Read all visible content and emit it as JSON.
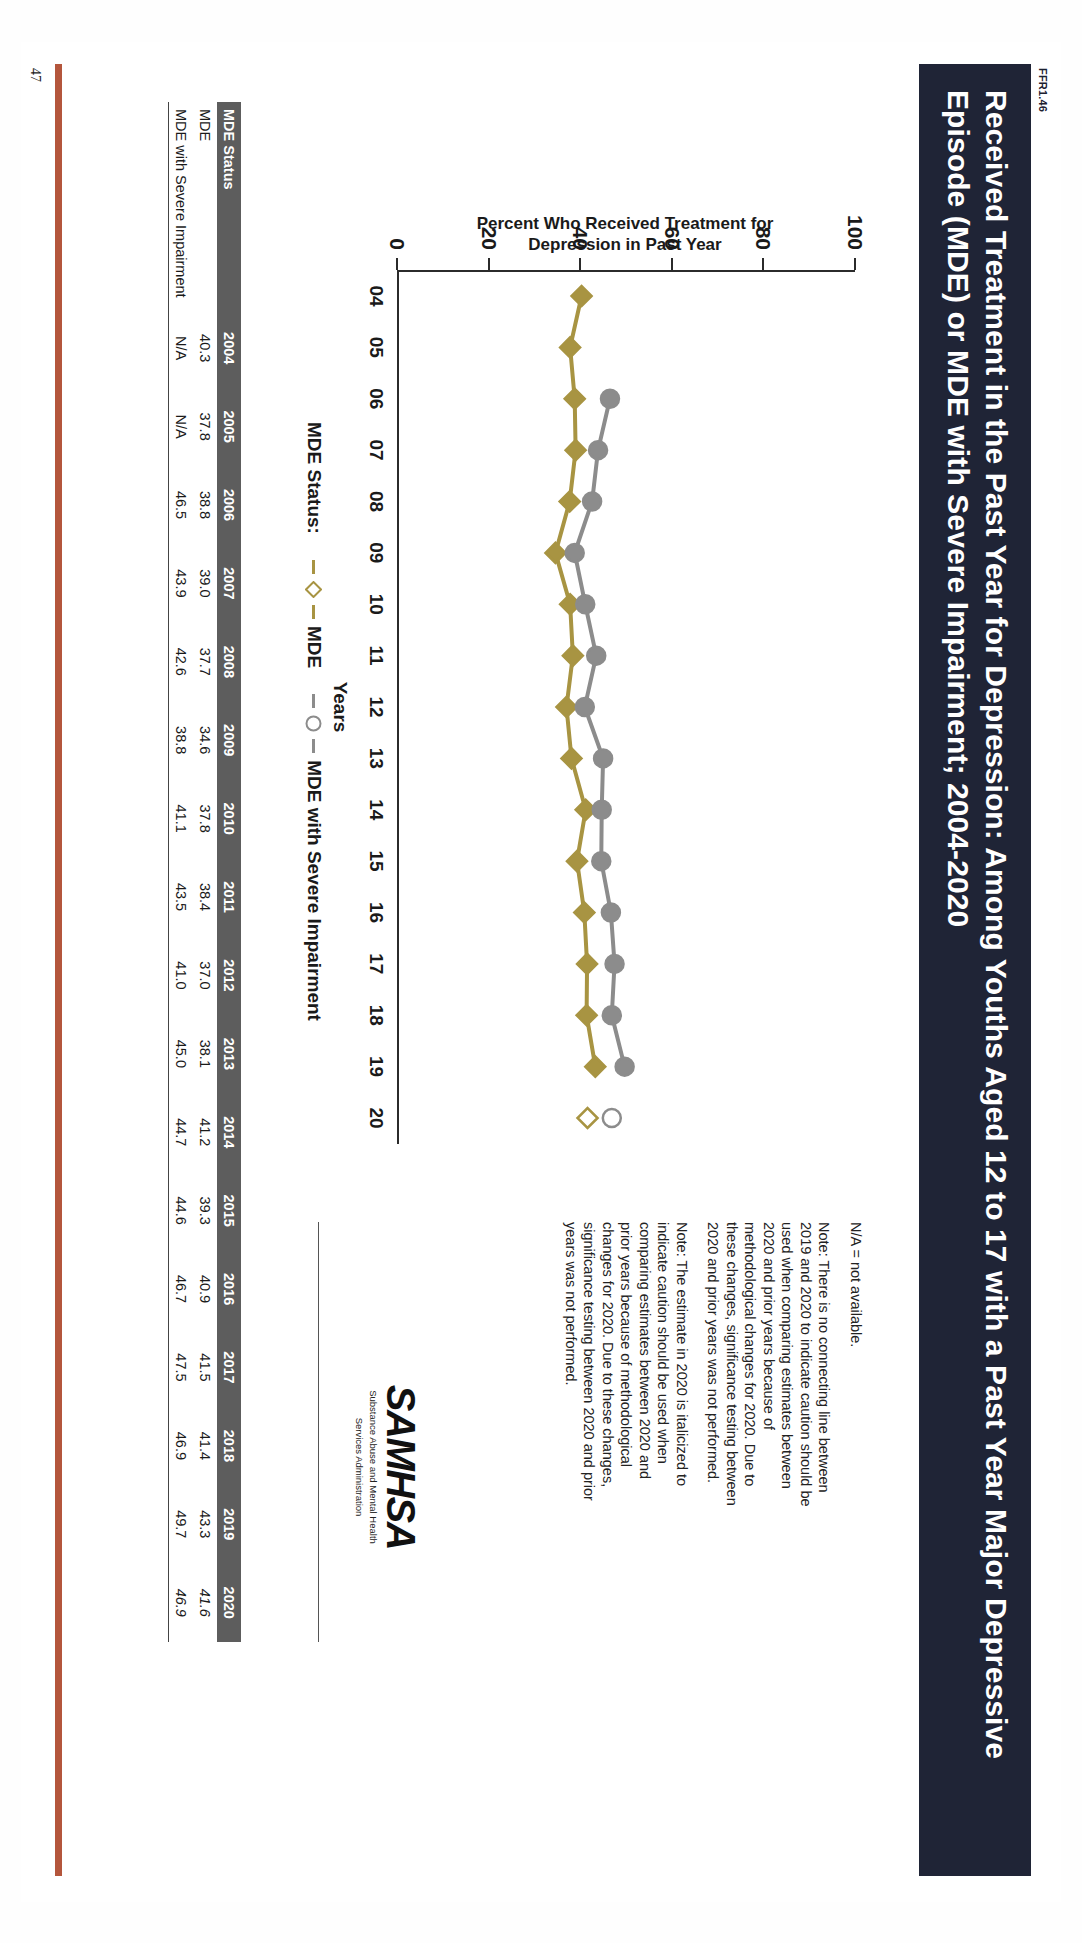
{
  "document": {
    "figure_code": "FFR1.46",
    "page_number": "47",
    "title": "Received Treatment in the Past Year for Depression: Among Youths Aged 12 to 17 with a Past Year Major Depressive Episode (MDE) or MDE with Severe Impairment; 2004-2020",
    "band_color": "#1f2436",
    "accent_rule_color": "#b4563c"
  },
  "notes": [
    "N/A = not available.",
    "Note: There is no connecting line between 2019 and 2020 to indicate caution should be used when comparing estimates between 2020 and prior years because of methodological changes for 2020. Due to these changes, significance testing between 2020 and prior years was not performed.",
    "Note: The estimate in 2020 is italicized to indicate caution should be used when comparing estimates between 2020 and prior years because of methodological changes for 2020. Due to these changes, significance testing between 2020 and prior years was not performed."
  ],
  "logo": {
    "mark": "SAMHSA",
    "line1": "Substance Abuse and Mental Health",
    "line2": "Services Administration"
  },
  "legend": {
    "prefix": "MDE Status:",
    "items": [
      {
        "label": "MDE",
        "color": "#a89442",
        "symbol": "diamond"
      },
      {
        "label": "MDE with Severe Impairment",
        "color": "#8c8c8c",
        "symbol": "circle"
      }
    ]
  },
  "chart_data": {
    "type": "line",
    "title": "Received Treatment in the Past Year for Depression: Among Youths Aged 12 to 17 with a Past Year Major Depressive Episode (MDE) or MDE with Severe Impairment; 2004-2020",
    "xlabel": "Years",
    "ylabel": "Percent Who Received Treatment for Depression in Past Year",
    "ylim": [
      0,
      100
    ],
    "yticks": [
      0,
      20,
      40,
      60,
      80,
      100
    ],
    "grid": false,
    "legend_position": "bottom",
    "x": [
      "2004",
      "2005",
      "2006",
      "2007",
      "2008",
      "2009",
      "2010",
      "2011",
      "2012",
      "2013",
      "2014",
      "2015",
      "2016",
      "2017",
      "2018",
      "2019",
      "2020"
    ],
    "xtick_labels": [
      "04",
      "05",
      "06",
      "07",
      "08",
      "09",
      "10",
      "11",
      "12",
      "13",
      "14",
      "15",
      "16",
      "17",
      "18",
      "19",
      "20"
    ],
    "series": [
      {
        "name": "MDE",
        "color": "#a89442",
        "symbol": "diamond",
        "values": [
          40.3,
          37.8,
          38.8,
          39.0,
          37.7,
          34.6,
          37.8,
          38.4,
          37.0,
          38.1,
          41.2,
          39.3,
          40.9,
          41.5,
          41.4,
          43.3,
          41.6
        ],
        "break_after": "2019"
      },
      {
        "name": "MDE with Severe Impairment",
        "color": "#8c8c8c",
        "symbol": "circle",
        "values": [
          null,
          null,
          46.5,
          43.9,
          42.6,
          38.8,
          41.1,
          43.5,
          41.0,
          45.0,
          44.7,
          44.6,
          46.7,
          47.5,
          46.9,
          49.7,
          46.9
        ],
        "break_after": "2019"
      }
    ]
  },
  "table": {
    "row_header_label": "MDE Status",
    "columns": [
      "2004",
      "2005",
      "2006",
      "2007",
      "2008",
      "2009",
      "2010",
      "2011",
      "2012",
      "2013",
      "2014",
      "2015",
      "2016",
      "2017",
      "2018",
      "2019",
      "2020"
    ],
    "rows": [
      {
        "label": "MDE",
        "values": [
          "40.3",
          "37.8",
          "38.8",
          "39.0",
          "37.7",
          "34.6",
          "37.8",
          "38.4",
          "37.0",
          "38.1",
          "41.2",
          "39.3",
          "40.9",
          "41.5",
          "41.4",
          "43.3",
          "41.6"
        ]
      },
      {
        "label": "MDE with Severe Impairment",
        "values": [
          "N/A",
          "N/A",
          "46.5",
          "43.9",
          "42.6",
          "38.8",
          "41.1",
          "43.5",
          "41.0",
          "45.0",
          "44.7",
          "44.6",
          "46.7",
          "47.5",
          "46.9",
          "49.7",
          "46.9"
        ]
      }
    ]
  }
}
